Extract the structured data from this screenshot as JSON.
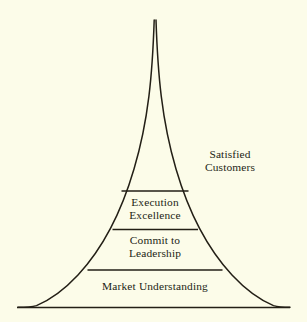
{
  "diagram": {
    "type": "bell-curve-pyramid",
    "title": "",
    "background_color": "#fcfce9",
    "line_color": "#231f16",
    "text_color": "#231f16",
    "tiers": [
      {
        "id": "satisfied-customers",
        "label": "Satisfied\nCustomers",
        "level": 4,
        "position": "outside-right"
      },
      {
        "id": "execution-excellence",
        "label": "Execution\nExcellence",
        "level": 3,
        "position": "inside"
      },
      {
        "id": "commit-to-leadership",
        "label": "Commit to\nLeadership",
        "level": 2,
        "position": "inside"
      },
      {
        "id": "market-understanding",
        "label": "Market Understanding",
        "level": 1,
        "position": "inside"
      }
    ],
    "dividers": [
      {
        "id": "divider-top",
        "y": 191,
        "x1": 122,
        "x2": 188
      },
      {
        "id": "divider-middle",
        "y": 229,
        "x1": 113,
        "x2": 198
      },
      {
        "id": "divider-lower",
        "y": 270,
        "x1": 88,
        "x2": 222
      }
    ],
    "baseline": {
      "y": 307,
      "x1": 17,
      "x2": 290
    },
    "apex": {
      "x": 155,
      "y": 20
    }
  }
}
